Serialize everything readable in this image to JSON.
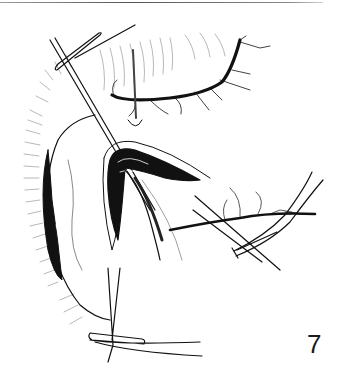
{
  "page": {
    "figure_number": "7",
    "illustration": "surgical-line-drawing"
  }
}
